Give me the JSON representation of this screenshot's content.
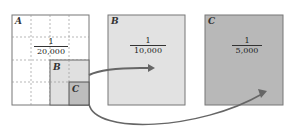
{
  "panels": {
    "a": {
      "label": "A",
      "scale_num": "1",
      "scale_den": "20,000",
      "color": "#ffffff"
    },
    "b": {
      "label": "B",
      "scale_num": "1",
      "scale_den": "10,000",
      "color": "#e2e2e2"
    },
    "c": {
      "label": "C",
      "scale_num": "1",
      "scale_den": "5,000",
      "color": "#b8b8b8"
    }
  },
  "inset": {
    "b_label": "B",
    "c_label": "C"
  }
}
